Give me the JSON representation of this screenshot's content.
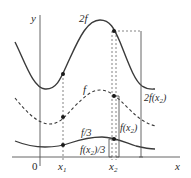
{
  "diagram": {
    "axes": {
      "y_label": "y",
      "x_label": "x",
      "origin_label": "0",
      "x1_label": "x",
      "x1_sub": "1",
      "x2_label": "x",
      "x2_sub": "2"
    },
    "curves": [
      {
        "name": "2f",
        "label": "2f",
        "style": "solid"
      },
      {
        "name": "f",
        "label": "f",
        "style": "dashed"
      },
      {
        "name": "f/3",
        "label": "f/3",
        "style": "solid"
      }
    ],
    "brackets": [
      {
        "label": "2f(x₂)",
        "label_main": "2f(x",
        "label_sub": "2",
        "label_end": ")"
      },
      {
        "label": "f(x₂)",
        "label_main": "f(x",
        "label_sub": "2",
        "label_end": ")"
      },
      {
        "label": "f(x₂)/3",
        "label_main": "f(x",
        "label_sub": "2",
        "label_end": ")/3"
      }
    ],
    "colors": {
      "line": "#3a3a3a",
      "axis": "#555555",
      "background": "#ffffff"
    }
  }
}
